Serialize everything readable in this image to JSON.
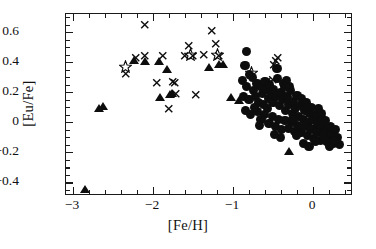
{
  "chart_data": {
    "type": "scatter",
    "title": "",
    "xlabel": "[Fe/H]",
    "ylabel": "[Eu/Fe]",
    "xlim": [
      -3.09,
      0.5
    ],
    "ylim": [
      -0.49,
      0.72
    ],
    "grid": false,
    "legend_position": "none",
    "xticks": [
      -3,
      -2,
      -1,
      0
    ],
    "xtick_labels": [
      "−3",
      "−2",
      "−1",
      "0"
    ],
    "xminor_step": 0.2,
    "yticks": [
      0.6,
      0.4,
      0.2,
      0,
      -0.2,
      -0.4
    ],
    "ytick_labels": [
      "0.6",
      "0.4",
      "0.2",
      "0",
      "−0.2",
      "−0.4"
    ],
    "yminor_step": 0.05,
    "series": [
      {
        "name": "filled-circles",
        "marker": "circle",
        "color": "#0d0d0d",
        "points": [
          [
            -0.83,
            0.47
          ],
          [
            -0.85,
            0.38
          ],
          [
            -0.79,
            0.32
          ],
          [
            -0.88,
            0.28
          ],
          [
            -0.83,
            0.24
          ],
          [
            -0.76,
            0.3
          ],
          [
            -0.87,
            0.17
          ],
          [
            -0.8,
            0.15
          ],
          [
            -0.84,
            0.08
          ],
          [
            -0.74,
            0.21
          ],
          [
            -0.7,
            0.26
          ],
          [
            -0.72,
            0.17
          ],
          [
            -0.66,
            0.24
          ],
          [
            -0.68,
            0.13
          ],
          [
            -0.63,
            0.19
          ],
          [
            -0.6,
            0.27
          ],
          [
            -0.58,
            0.22
          ],
          [
            -0.62,
            0.12
          ],
          [
            -0.56,
            0.16
          ],
          [
            -0.54,
            0.25
          ],
          [
            -0.52,
            0.19
          ],
          [
            -0.5,
            0.13
          ],
          [
            -0.57,
            0.09
          ],
          [
            -0.61,
            0.05
          ],
          [
            -0.65,
            0.02
          ],
          [
            -0.49,
            0.22
          ],
          [
            -0.46,
            0.17
          ],
          [
            -0.45,
            0.36
          ],
          [
            -0.44,
            0.29
          ],
          [
            -0.42,
            0.11
          ],
          [
            -0.4,
            0.2
          ],
          [
            -0.38,
            0.15
          ],
          [
            -0.36,
            0.24
          ],
          [
            -0.34,
            0.08
          ],
          [
            -0.32,
            0.17
          ],
          [
            -0.3,
            0.12
          ],
          [
            -0.28,
            0.21
          ],
          [
            -0.26,
            0.06
          ],
          [
            -0.24,
            0.14
          ],
          [
            -0.22,
            0.09
          ],
          [
            -0.2,
            0.18
          ],
          [
            -0.18,
            0.04
          ],
          [
            -0.16,
            0.11
          ],
          [
            -0.14,
            0.16
          ],
          [
            -0.12,
            0.02
          ],
          [
            -0.1,
            0.08
          ],
          [
            -0.08,
            0.13
          ],
          [
            -0.06,
            0.0
          ],
          [
            -0.04,
            0.06
          ],
          [
            -0.02,
            0.1
          ],
          [
            0.0,
            0.02
          ],
          [
            0.02,
            -0.04
          ],
          [
            0.04,
            0.05
          ],
          [
            0.06,
            0.0
          ],
          [
            0.08,
            -0.06
          ],
          [
            0.1,
            0.03
          ],
          [
            0.12,
            -0.02
          ],
          [
            0.14,
            -0.08
          ],
          [
            0.16,
            0.01
          ],
          [
            0.18,
            -0.05
          ],
          [
            0.2,
            -0.11
          ],
          [
            0.22,
            -0.03
          ],
          [
            0.24,
            -0.08
          ],
          [
            0.26,
            -0.14
          ],
          [
            0.28,
            -0.05
          ],
          [
            0.3,
            -0.1
          ],
          [
            0.33,
            -0.15
          ],
          [
            -0.55,
            -0.01
          ],
          [
            -0.51,
            0.04
          ],
          [
            -0.47,
            -0.03
          ],
          [
            -0.43,
            0.02
          ],
          [
            -0.39,
            -0.05
          ],
          [
            -0.35,
            0.01
          ],
          [
            -0.31,
            -0.04
          ],
          [
            -0.27,
            0.0
          ],
          [
            -0.23,
            -0.06
          ],
          [
            -0.19,
            -0.02
          ],
          [
            -0.15,
            -0.07
          ],
          [
            -0.11,
            -0.03
          ],
          [
            -0.07,
            -0.09
          ],
          [
            -0.03,
            -0.05
          ],
          [
            0.01,
            -0.11
          ],
          [
            0.05,
            -0.07
          ],
          [
            0.09,
            -0.12
          ],
          [
            0.13,
            -0.09
          ],
          [
            0.17,
            -0.13
          ],
          [
            -0.37,
            0.26
          ],
          [
            -0.33,
            0.28
          ],
          [
            -0.29,
            0.24
          ],
          [
            -0.69,
            0.07
          ],
          [
            -0.73,
            0.1
          ],
          [
            -0.78,
            0.05
          ],
          [
            -0.67,
            -0.02
          ],
          [
            -0.12,
            -0.14
          ],
          [
            -0.05,
            -0.16
          ],
          [
            0.03,
            -0.13
          ],
          [
            0.21,
            -0.16
          ],
          [
            0.27,
            -0.12
          ],
          [
            -0.41,
            -0.1
          ],
          [
            -0.48,
            -0.08
          ],
          [
            0.07,
            0.09
          ],
          [
            0.11,
            0.06
          ],
          [
            -0.25,
            0.02
          ],
          [
            -0.21,
            -0.09
          ]
        ]
      },
      {
        "name": "filled-triangles",
        "marker": "triangle",
        "color": "#0d0d0d",
        "points": [
          [
            -2.85,
            -0.45
          ],
          [
            -2.68,
            0.09
          ],
          [
            -2.63,
            0.1
          ],
          [
            -2.24,
            0.41
          ],
          [
            -2.1,
            0.4
          ],
          [
            -1.93,
            0.4
          ],
          [
            -1.92,
            0.16
          ],
          [
            -1.83,
            0.35
          ],
          [
            -1.79,
            0.18
          ],
          [
            -1.76,
            0.19
          ],
          [
            -1.3,
            0.36
          ],
          [
            -1.17,
            0.38
          ],
          [
            -1.13,
            0.38
          ],
          [
            -1.03,
            0.16
          ],
          [
            -0.93,
            0.14
          ],
          [
            -0.3,
            -0.2
          ]
        ]
      },
      {
        "name": "crosses",
        "marker": "cross",
        "color": "#0d0d0d",
        "points": [
          [
            -2.1,
            0.65
          ],
          [
            -2.34,
            0.32
          ],
          [
            -2.22,
            0.43
          ],
          [
            -2.11,
            0.44
          ],
          [
            -1.95,
            0.26
          ],
          [
            -1.8,
            0.09
          ],
          [
            -1.76,
            0.27
          ],
          [
            -1.73,
            0.26
          ],
          [
            -1.72,
            0.19
          ],
          [
            -1.55,
            0.51
          ],
          [
            -1.5,
            0.44
          ],
          [
            -1.47,
            0.18
          ],
          [
            -1.37,
            0.45
          ],
          [
            -1.27,
            0.61
          ],
          [
            -1.22,
            0.52
          ],
          [
            -1.18,
            0.44
          ],
          [
            -0.58,
            0.27
          ],
          [
            -0.5,
            0.28
          ],
          [
            -0.47,
            0.41
          ],
          [
            -0.44,
            0.43
          ],
          [
            -0.49,
            0.38
          ],
          [
            -1.6,
            0.44
          ],
          [
            -1.88,
            0.44
          ]
        ]
      },
      {
        "name": "open-stars",
        "marker": "star",
        "color": "#0d0d0d",
        "points": [
          [
            -2.35,
            0.37
          ],
          [
            -1.53,
            0.45
          ],
          [
            -1.19,
            0.45
          ],
          [
            -0.77,
            0.33
          ]
        ]
      }
    ]
  }
}
